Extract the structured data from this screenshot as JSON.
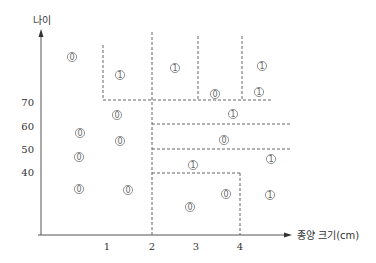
{
  "diagram": {
    "y_axis_label": "나이",
    "x_axis_label": "종양 크기(cm)",
    "x_ticks": [
      {
        "label": "1",
        "x": 107
      },
      {
        "label": "2",
        "x": 152
      },
      {
        "label": "3",
        "x": 196
      },
      {
        "label": "4",
        "x": 240
      }
    ],
    "y_ticks": [
      {
        "label": "70",
        "y": 102
      },
      {
        "label": "60",
        "y": 126
      },
      {
        "label": "50",
        "y": 149
      },
      {
        "label": "40",
        "y": 172
      }
    ],
    "class_symbols": {
      "class0": "0",
      "class1": "1"
    },
    "points": [
      {
        "cls": "0",
        "x": 72,
        "y": 57
      },
      {
        "cls": "1",
        "x": 120,
        "y": 75
      },
      {
        "cls": "1",
        "x": 175,
        "y": 68
      },
      {
        "cls": "1",
        "x": 262,
        "y": 66
      },
      {
        "cls": "0",
        "x": 215,
        "y": 94
      },
      {
        "cls": "1",
        "x": 259,
        "y": 92
      },
      {
        "cls": "1",
        "x": 233,
        "y": 114
      },
      {
        "cls": "0",
        "x": 117,
        "y": 115
      },
      {
        "cls": "0",
        "x": 80,
        "y": 133
      },
      {
        "cls": "0",
        "x": 120,
        "y": 141
      },
      {
        "cls": "0",
        "x": 224,
        "y": 140
      },
      {
        "cls": "0",
        "x": 79,
        "y": 157
      },
      {
        "cls": "1",
        "x": 271,
        "y": 159
      },
      {
        "cls": "1",
        "x": 193,
        "y": 165
      },
      {
        "cls": "0",
        "x": 79,
        "y": 189
      },
      {
        "cls": "0",
        "x": 128,
        "y": 190
      },
      {
        "cls": "0",
        "x": 226,
        "y": 194
      },
      {
        "cls": "1",
        "x": 270,
        "y": 195
      },
      {
        "cls": "0",
        "x": 190,
        "y": 207
      }
    ]
  }
}
